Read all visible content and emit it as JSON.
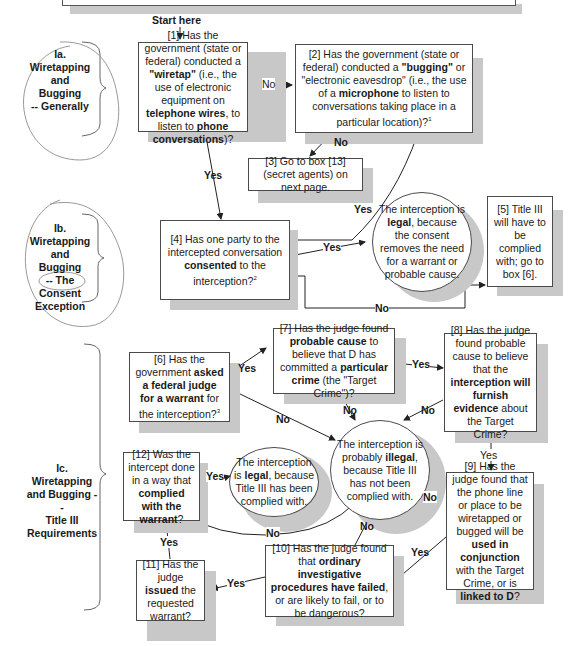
{
  "start_label": "Start here",
  "sections": [
    {
      "id": "Ia",
      "line1": "Ia.",
      "line2": "Wiretapping",
      "line3": "and Bugging",
      "line4": "-- Generally"
    },
    {
      "id": "Ib",
      "line1": "Ib.",
      "line2": "Wiretapping",
      "line3": "and Bugging",
      "line4": "-- The",
      "line5": "Consent",
      "line6": "Exception"
    },
    {
      "id": "Ic",
      "line1": "Ic.",
      "line2": "Wiretapping",
      "line3": "and Bugging --",
      "line4": "Title III",
      "line5": "Requirements"
    }
  ],
  "boxes": {
    "b1": {
      "p1": "[1] Has the government (state or federal) conducted a ",
      "b1": "\"wiretap\"",
      "p2": " (i.e., the use of electronic equipment on ",
      "b2": "telephone wires",
      "p3": ", to listen to ",
      "b3": "phone conversations",
      "p4": ")?"
    },
    "b2": {
      "p1": "[2] Has the government (state or federal) conducted a ",
      "b1": "\"bugging\"",
      "p2": " or \"electronic eavesdrop\" (i.e., the use of a ",
      "b2": "microphone",
      "p3": " to listen to conversations taking place in a particular location)?",
      "sup": "1"
    },
    "b3": {
      "text": "[3] Go to box [13] (secret agents) on next page."
    },
    "b4": {
      "p1": "[4] Has one party to the intercepted conversation ",
      "b1": "consented",
      "p2": " to the interception?",
      "sup": "2"
    },
    "b5": {
      "text": "[5] Title III will have to be complied with; go to box [6]."
    },
    "b6": {
      "p1": "[6] Has the government ",
      "b1": "asked a federal judge for a warrant",
      "p2": " for the interception?",
      "sup": "3"
    },
    "b7": {
      "p1": "[7] Has the judge found ",
      "b1": "probable cause",
      "p2": " to believe that D has committed a ",
      "b2": "particular crime",
      "p3": " (the \"Target Crime\")?"
    },
    "b8": {
      "p1": "[8] Has the judge found probable cause to believe that the ",
      "b1": "interception will furnish evidence",
      "p2": " about the Target Crime?"
    },
    "b9": {
      "p1": "[9] Has the judge found that the phone line or place to be wiretapped or bugged will be ",
      "b1": "used in conjunction",
      "p2": " with the Target Crime, or is ",
      "b2": "linked to D",
      "p3": "?"
    },
    "b10": {
      "p1": "[10] Has the judge found that ",
      "b1": "ordinary investigative procedures have failed",
      "p2": ", or are likely to fail, or to be dangerous?"
    },
    "b11": {
      "p1": "[11] Has the judge ",
      "b1": "issued",
      "p2": " the requested warrant?"
    },
    "b12": {
      "p1": "[12] Was the intercept done in a way that ",
      "b1": "complied with the warrant",
      "p2": "?"
    }
  },
  "circles": {
    "legal_consent": {
      "p1": "The interception is ",
      "b1": "legal",
      "p2": ", because the consent removes the need for a warrant or probable cause."
    },
    "illegal": {
      "p1": "The interception is probably ",
      "b1": "illegal",
      "p2": ", because Title III has not been complied with."
    },
    "legal_title3": {
      "p1": "The interception is ",
      "b1": "legal",
      "p2": ", because Title III has been complied with."
    }
  },
  "edge_labels": {
    "b1_no": "No",
    "b1_yes": "Yes",
    "b2_no": "No",
    "b2_yes": "Yes",
    "b4_yes": "Yes",
    "b4_no": "No",
    "b6_yes": "Yes",
    "b6_no": "No",
    "b7_yes": "Yes",
    "b7_no": "No",
    "b8_no": "No",
    "b8_yes": "Yes",
    "b9_no": "No",
    "b9_yes": "Yes",
    "b10_no": "No",
    "b10_yes": "Yes",
    "b11_yes": "Yes",
    "b12_yes": "Yes",
    "b12_no": "No"
  },
  "colors": {
    "border": "#4a4a4a",
    "shadow": "#c8c8c8",
    "annotation": "#8a8a8a"
  }
}
